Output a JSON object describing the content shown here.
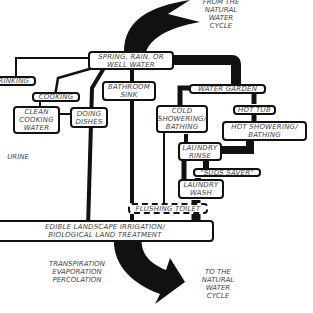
{
  "diagram": {
    "type": "water-flow-diagram",
    "source_label": "FROM THE\nNATURAL\nWATER\nCYCLE",
    "sink_label": "TO THE\nNATURAL\nWATER\nCYCLE",
    "loss_label": "TRANSPIRATION\nEVAPORATION\nPERCOLATION",
    "urine_label": "URINE",
    "nodes": {
      "supply": "SPRING, RAIN, OR\nWELL WATER",
      "drinking": "DRINKING",
      "cooking": "COOKING",
      "clean_cooking_water": "CLEAN\nCOOKING\nWATER",
      "doing_dishes": "DOING\nDISHES",
      "bathroom_sink": "BATHROOM\nSINK",
      "water_garden": "WATER GARDEN",
      "hot_tub": "HOT TUB",
      "cold_showering": "COLD\nSHOWERING/\nBATHING",
      "hot_showering": "HOT SHOWERING/\nBATHING",
      "laundry_rinse": "LAUNDRY\nRINSE",
      "suds_saver": "\"SUDS SAVER\"",
      "laundry_wash": "LAUNDRY\nWASH",
      "flushing_toilet": "FLUSHING TOILET",
      "irrigation": "EDIBLE LANDSCAPE IRRIGATION/\nBIOLOGICAL LAND TREATMENT"
    },
    "edges": [
      [
        "source",
        "supply"
      ],
      [
        "supply",
        "drinking"
      ],
      [
        "supply",
        "cooking"
      ],
      [
        "cooking",
        "clean_cooking_water"
      ],
      [
        "clean_cooking_water",
        "doing_dishes"
      ],
      [
        "supply",
        "doing_dishes"
      ],
      [
        "supply",
        "bathroom_sink"
      ],
      [
        "supply",
        "water_garden"
      ],
      [
        "water_garden",
        "cold_showering"
      ],
      [
        "water_garden",
        "hot_tub"
      ],
      [
        "hot_tub",
        "hot_showering"
      ],
      [
        "hot_showering",
        "laundry_rinse"
      ],
      [
        "cold_showering",
        "laundry_rinse"
      ],
      [
        "laundry_rinse",
        "suds_saver"
      ],
      [
        "suds_saver",
        "laundry_wash"
      ],
      [
        "laundry_wash",
        "flushing_toilet"
      ],
      [
        "cold_showering",
        "flushing_toilet"
      ],
      [
        "bathroom_sink",
        "flushing_toilet"
      ],
      [
        "doing_dishes",
        "irrigation"
      ],
      [
        "flushing_toilet",
        "irrigation"
      ],
      [
        "irrigation",
        "sink"
      ]
    ]
  }
}
